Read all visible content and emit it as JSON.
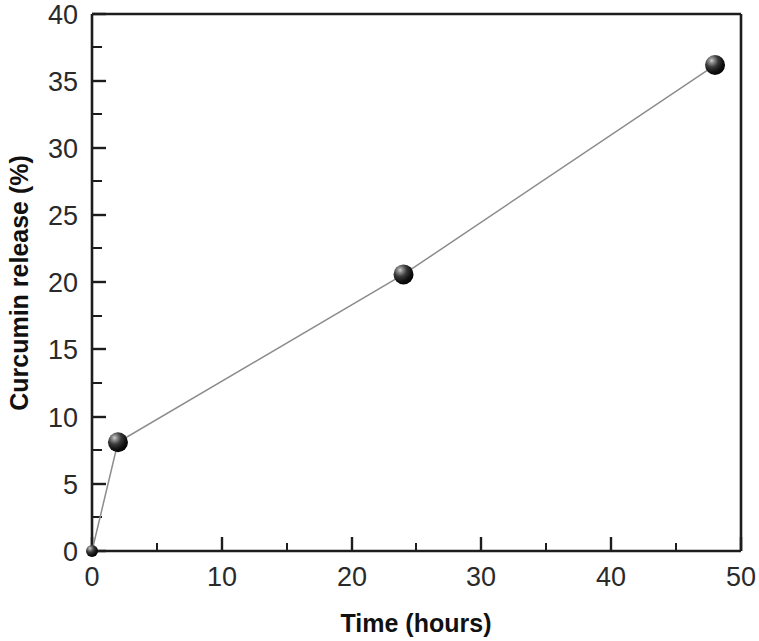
{
  "chart_data": {
    "type": "line",
    "title": "",
    "subtitle": "",
    "xlabel": "Time (hours)",
    "ylabel": "Curcumin release (%)",
    "xlim": [
      0,
      50
    ],
    "ylim": [
      0,
      40
    ],
    "grid": false,
    "legend": false,
    "legend_position": "none",
    "x_major_ticks": [
      0,
      10,
      20,
      30,
      40,
      50
    ],
    "x_minor_ticks": [
      5,
      15,
      25,
      35,
      45
    ],
    "y_major_ticks": [
      0,
      5,
      10,
      15,
      20,
      25,
      30,
      35,
      40
    ],
    "y_minor_ticks": [
      2.5,
      7.5,
      12.5,
      17.5,
      22.5,
      27.5,
      32.5,
      37.5
    ],
    "x_tick_labels": [
      "0",
      "10",
      "20",
      "30",
      "40",
      "50"
    ],
    "y_tick_labels": [
      "0",
      "5",
      "10",
      "15",
      "20",
      "25",
      "30",
      "35",
      "40"
    ],
    "tick_direction": "in",
    "marker_style": "sphere-3d",
    "marker_color": "#141414",
    "line_color": "#8c8c8c",
    "axis_color": "#1d1d1d",
    "background_color": "#ffffff",
    "x": [
      0,
      2,
      24,
      48
    ],
    "values": [
      0,
      8.1,
      20.6,
      36.2
    ],
    "series": [
      {
        "name": "Curcumin release",
        "points": [
          {
            "x": 0,
            "y": 0
          },
          {
            "x": 2,
            "y": 8.1
          },
          {
            "x": 24,
            "y": 20.6
          },
          {
            "x": 48,
            "y": 36.2
          }
        ]
      }
    ]
  }
}
